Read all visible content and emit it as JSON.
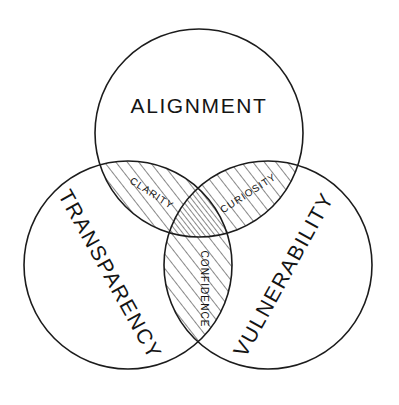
{
  "diagram": {
    "type": "venn-3-circle",
    "background_color": "#ffffff",
    "stroke_color": "#1c1c1c",
    "hatch_color": "#1c1c1c",
    "circles": [
      {
        "id": "alignment",
        "label": "ALIGNMENT",
        "cx": 199,
        "cy": 133,
        "r": 104,
        "label_x": 199,
        "label_y": 113,
        "rotation": 0
      },
      {
        "id": "transparency",
        "label": "TRANSPARENCY",
        "cx": 128,
        "cy": 265,
        "r": 104,
        "label_x": 104,
        "label_y": 278,
        "rotation": 61
      },
      {
        "id": "vulnerability",
        "label": "VULNERABILITY",
        "cx": 268,
        "cy": 265,
        "r": 104,
        "label_x": 290,
        "label_y": 278,
        "rotation": -61
      }
    ],
    "intersections": [
      {
        "id": "clarity",
        "label": "CLARITY",
        "between": [
          "alignment",
          "transparency"
        ],
        "label_x": 150,
        "label_y": 196,
        "rotation": 33,
        "hatch": "diagonal-up"
      },
      {
        "id": "curiosity",
        "label": "CURIOSITY",
        "between": [
          "alignment",
          "vulnerability"
        ],
        "label_x": 250,
        "label_y": 196,
        "rotation": -33,
        "hatch": "diagonal-up"
      },
      {
        "id": "confidence",
        "label": "CONFIDENCE",
        "between": [
          "transparency",
          "vulnerability"
        ],
        "label_x": 201,
        "label_y": 289,
        "rotation": 90,
        "hatch": "diagonal-up"
      }
    ],
    "center": {
      "id": "core",
      "label": "",
      "between": [
        "alignment",
        "transparency",
        "vulnerability"
      ],
      "hatch": "diagonal-up-dense"
    }
  }
}
